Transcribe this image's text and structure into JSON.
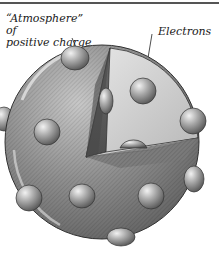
{
  "figure": {
    "labels": {
      "atmosphere_line1": "“Atmosphere” of",
      "atmosphere_line2": "positive charge",
      "electrons": "Electrons"
    },
    "colors": {
      "sphere_dark": "#6e6e6e",
      "sphere_mid": "#9a9a9a",
      "sphere_light": "#cfcfcf",
      "cut_face_dark": "#5a5a5a",
      "cut_face_light": "#e2e2e2",
      "electron": "#a8a8a8",
      "line": "#222222"
    }
  }
}
